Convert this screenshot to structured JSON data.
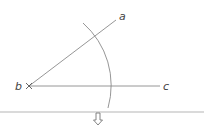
{
  "diagram": {
    "type": "geometric-construction",
    "points": {
      "a": {
        "label": "a"
      },
      "b": {
        "label": "b"
      },
      "c": {
        "label": "c"
      }
    },
    "colors": {
      "line": "#8a8a8a",
      "arc": "#8a8a8a",
      "label": "#444444",
      "divider": "#b5b5b5",
      "arrow": "#777777"
    }
  },
  "footer": {
    "arrow_icon": "down-double-arrow"
  }
}
